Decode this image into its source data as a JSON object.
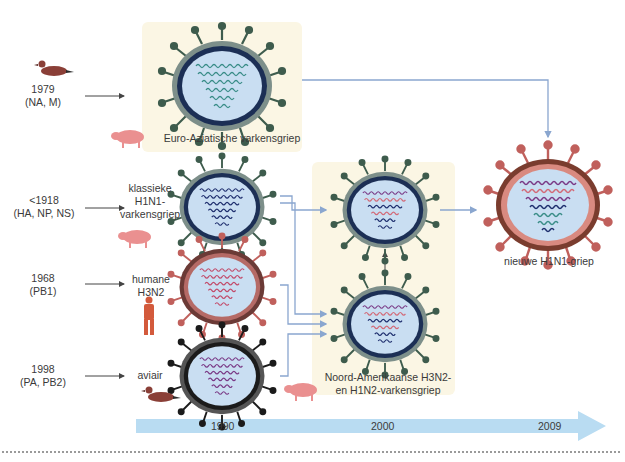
{
  "colors": {
    "box_bg": "#fbf6e4",
    "arrow_blue": "#8aa6cf",
    "timeline_blue": "#b9dcf2",
    "core_fill": "#c9def2",
    "virus_green": "#3e5c4d",
    "virus_red": "#c0605c",
    "virus_black": "#1b1b1b",
    "rna_teal": "#3a8d88",
    "rna_navy": "#1f2f6e",
    "rna_pink": "#d26a78",
    "rna_purple": "#7a3a86",
    "animal_duck": "#8a3f37",
    "animal_pig": "#ea9090",
    "animal_human": "#d35a3c"
  },
  "sources": [
    {
      "id": "duck-1979",
      "year": "1979",
      "segments": "(NA, M)",
      "host": "duck"
    },
    {
      "id": "classic-1918",
      "year": "<1918",
      "segments": "(HA, NP, NS)",
      "host": "pig",
      "virus_label": [
        "klassieke",
        "H1N1-",
        "varkensgriep"
      ]
    },
    {
      "id": "human-1968",
      "year": "1968",
      "segments": "(PB1)",
      "host": "human",
      "virus_label": [
        "humane",
        "H3N2"
      ]
    },
    {
      "id": "avian-1998",
      "year": "1998",
      "segments": "(PA, PB2)",
      "host": "duck",
      "virus_label": [
        "aviair"
      ]
    }
  ],
  "boxes": {
    "euro_asian": {
      "label": "Euro-Aziatische varkensgriep"
    },
    "north_american": {
      "label_line1": "Noord-Amerikaanse H3N2-",
      "label_line2": "en H1N2-varkensgriep"
    }
  },
  "result": {
    "label": "nieuwe H1N1-griep"
  },
  "timeline": {
    "ticks": [
      "1990",
      "2000",
      "2009"
    ]
  }
}
